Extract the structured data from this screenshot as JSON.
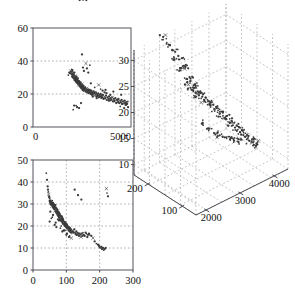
{
  "figure": {
    "background_color": "#ffffff",
    "point_color": "#3a3a3a",
    "axis_color": "#4a4a52",
    "grid_color": "#9a9a9a"
  },
  "chart_data": [
    {
      "id": "panel-top-left",
      "type": "scatter",
      "title": "",
      "xlabel": "",
      "ylabel": "",
      "xlim": [
        0,
        5000
      ],
      "ylim": [
        0,
        60
      ],
      "xticks": [
        0,
        5000
      ],
      "xticklabels": [
        "0",
        "5000"
      ],
      "yticks": [
        0,
        20,
        40,
        60
      ],
      "yticklabels": [
        "0",
        "20",
        "40",
        "60"
      ],
      "grid": true,
      "grid_axis": "y",
      "grid_values": [
        20,
        40
      ],
      "legend": null,
      "x": [
        1800,
        1850,
        1900,
        1920,
        1950,
        1970,
        1990,
        2000,
        2010,
        2020,
        2030,
        2050,
        2060,
        2080,
        2090,
        2100,
        2110,
        2120,
        2130,
        2150,
        2160,
        2170,
        2180,
        2190,
        2200,
        2210,
        2220,
        2230,
        2240,
        2250,
        2260,
        2270,
        2280,
        2290,
        2300,
        2310,
        2320,
        2330,
        2340,
        2350,
        2360,
        2370,
        2380,
        2390,
        2400,
        2410,
        2420,
        2430,
        2440,
        2450,
        2460,
        2470,
        2480,
        2490,
        2500,
        2510,
        2520,
        2530,
        2540,
        2550,
        2560,
        2570,
        2580,
        2590,
        2600,
        2620,
        2640,
        2660,
        2680,
        2700,
        2720,
        2740,
        2760,
        2780,
        2800,
        2820,
        2840,
        2860,
        2880,
        2900,
        2920,
        2940,
        2960,
        2980,
        3000,
        3030,
        3060,
        3090,
        3120,
        3150,
        3180,
        3210,
        3240,
        3270,
        3300,
        3330,
        3360,
        3390,
        3420,
        3450,
        3480,
        3510,
        3540,
        3570,
        3600,
        3640,
        3680,
        3720,
        3760,
        3800,
        3840,
        3880,
        3920,
        3960,
        4000,
        4040,
        4080,
        4120,
        4160,
        4200,
        4240,
        4280,
        4320,
        4360,
        4400,
        4440,
        4480,
        4520,
        4560,
        4600,
        4640,
        4680,
        4720,
        4760,
        4800,
        4840,
        2100,
        2450,
        2500,
        2700,
        2900,
        3100,
        3300,
        3500,
        3700,
        3900,
        4100,
        4300,
        4500,
        4700,
        2200,
        2350,
        2550,
        2750,
        2950,
        3150,
        3350,
        3550,
        3750,
        3950,
        4150,
        4350,
        4550,
        4750,
        2250,
        2050,
        2600,
        2820,
        3050,
        3250,
        3450,
        3650,
        3850,
        4050,
        4250,
        4450,
        4650,
        4850
      ],
      "y": [
        31.5,
        33.0,
        32.5,
        34.0,
        33.5,
        35.0,
        32.0,
        30.5,
        34.5,
        31.0,
        33.5,
        30.0,
        32.5,
        29.5,
        31.5,
        30.0,
        33.0,
        28.5,
        30.5,
        29.0,
        31.0,
        28.0,
        30.0,
        27.5,
        29.5,
        28.5,
        30.5,
        27.0,
        29.0,
        28.0,
        26.5,
        28.5,
        27.5,
        29.5,
        26.0,
        28.0,
        27.0,
        25.5,
        27.5,
        26.5,
        28.0,
        25.0,
        27.0,
        26.0,
        24.5,
        26.5,
        25.5,
        27.0,
        24.0,
        26.0,
        25.0,
        23.5,
        25.5,
        24.5,
        26.0,
        23.0,
        25.0,
        24.0,
        22.5,
        24.5,
        23.5,
        25.0,
        22.0,
        24.0,
        23.0,
        23.5,
        22.5,
        24.0,
        21.5,
        23.0,
        22.0,
        23.5,
        21.0,
        22.5,
        21.5,
        23.0,
        20.5,
        22.0,
        21.0,
        22.5,
        20.0,
        21.5,
        20.5,
        22.0,
        19.5,
        21.0,
        20.0,
        21.5,
        19.0,
        20.5,
        19.5,
        21.0,
        18.5,
        20.0,
        19.0,
        20.5,
        18.0,
        19.5,
        18.5,
        20.0,
        17.5,
        19.0,
        18.0,
        19.5,
        17.0,
        18.5,
        17.5,
        19.0,
        16.5,
        18.0,
        17.0,
        18.5,
        16.0,
        17.5,
        16.5,
        18.0,
        15.5,
        17.0,
        16.0,
        17.5,
        15.0,
        16.5,
        15.5,
        17.0,
        14.5,
        16.0,
        15.0,
        16.5,
        14.0,
        15.5,
        14.5,
        16.0,
        13.5,
        15.0,
        14.0,
        15.5,
        13.0,
        14.5,
        44.0,
        38.5,
        37.5,
        21.5,
        19.0,
        18.0,
        22.5,
        17.0,
        21.5,
        16.5,
        19.5,
        14.5,
        13.0,
        11.5,
        36.0,
        35.5,
        26.5,
        24.0,
        25.5,
        22.0,
        20.5,
        19.5,
        15.5,
        15.0,
        14.0,
        13.5,
        12.0,
        10.5,
        34.0,
        33.0,
        18.5,
        17.5,
        23.0,
        21.0,
        16.0,
        18.0,
        14.5,
        12.5,
        11.5,
        12.0,
        10.0,
        9.5
      ]
    },
    {
      "id": "panel-bottom-left",
      "type": "scatter",
      "title": "",
      "xlabel": "",
      "ylabel": "",
      "xlim": [
        0,
        300
      ],
      "ylim": [
        0,
        50
      ],
      "xticks": [
        0,
        100,
        200,
        300
      ],
      "xticklabels": [
        "0",
        "100",
        "200",
        "300"
      ],
      "yticks": [
        0,
        10,
        20,
        30,
        40,
        50
      ],
      "yticklabels": [
        "0",
        "10",
        "20",
        "30",
        "40",
        "50"
      ],
      "grid": true,
      "grid_axis": "both",
      "grid_values_x": [
        100,
        200
      ],
      "grid_values_y": [
        10,
        20,
        30,
        40
      ],
      "legend": null,
      "x": [
        40,
        42,
        44,
        45,
        46,
        47,
        48,
        49,
        50,
        50,
        51,
        52,
        52,
        53,
        54,
        55,
        55,
        56,
        57,
        58,
        58,
        59,
        60,
        60,
        61,
        62,
        62,
        63,
        64,
        64,
        65,
        66,
        66,
        67,
        68,
        68,
        69,
        70,
        70,
        71,
        72,
        72,
        73,
        74,
        74,
        75,
        76,
        76,
        77,
        78,
        78,
        79,
        80,
        80,
        81,
        82,
        82,
        83,
        84,
        85,
        85,
        86,
        87,
        88,
        88,
        89,
        90,
        90,
        91,
        92,
        93,
        94,
        95,
        95,
        96,
        97,
        98,
        99,
        100,
        100,
        101,
        102,
        103,
        104,
        105,
        106,
        107,
        108,
        109,
        110,
        111,
        112,
        113,
        114,
        115,
        116,
        118,
        120,
        122,
        124,
        126,
        128,
        130,
        132,
        134,
        136,
        138,
        140,
        142,
        144,
        146,
        148,
        150,
        152,
        155,
        158,
        160,
        163,
        165,
        168,
        170,
        175,
        180,
        185,
        190,
        195,
        198,
        200,
        202,
        205,
        207,
        210,
        212,
        215,
        218,
        220,
        222,
        225,
        50,
        52,
        58,
        65,
        70,
        78,
        85,
        92,
        100,
        108,
        115,
        125,
        135,
        145,
        55,
        60,
        68,
        75,
        82,
        88,
        95,
        102,
        110,
        120,
        130,
        140,
        150,
        160
      ],
      "y": [
        44.0,
        41.0,
        38.0,
        36.5,
        35.5,
        34.5,
        33.5,
        33.0,
        32.5,
        31.5,
        31.0,
        30.5,
        30.0,
        31.5,
        30.0,
        29.5,
        31.0,
        30.5,
        29.0,
        30.0,
        31.5,
        29.5,
        28.5,
        30.5,
        29.0,
        28.0,
        30.0,
        29.5,
        27.5,
        29.0,
        28.5,
        27.0,
        28.0,
        29.5,
        26.5,
        28.5,
        27.5,
        26.0,
        28.0,
        27.0,
        25.5,
        27.5,
        26.5,
        25.0,
        27.0,
        26.0,
        24.5,
        26.5,
        25.5,
        24.0,
        26.0,
        25.0,
        23.5,
        25.5,
        24.5,
        23.0,
        25.0,
        24.0,
        22.5,
        24.5,
        23.5,
        22.0,
        24.0,
        23.0,
        21.5,
        23.5,
        22.5,
        21.0,
        23.0,
        22.0,
        21.5,
        20.5,
        22.0,
        21.0,
        20.0,
        21.5,
        20.5,
        19.5,
        21.0,
        20.0,
        19.0,
        20.5,
        19.5,
        18.5,
        20.0,
        19.0,
        18.0,
        19.5,
        18.5,
        17.5,
        19.0,
        18.0,
        17.0,
        18.5,
        17.5,
        17.0,
        18.0,
        17.5,
        17.0,
        18.5,
        17.0,
        16.5,
        17.5,
        16.0,
        17.0,
        16.5,
        15.5,
        16.5,
        16.0,
        15.0,
        16.5,
        15.5,
        17.0,
        16.0,
        15.5,
        17.0,
        16.5,
        15.0,
        16.0,
        16.5,
        16.0,
        15.5,
        14.5,
        13.0,
        12.0,
        11.5,
        11.0,
        10.5,
        10.0,
        10.5,
        9.5,
        10.0,
        9.0,
        9.5,
        10.0,
        37.0,
        35.0,
        33.5,
        22.0,
        26.5,
        24.0,
        20.5,
        19.5,
        22.5,
        20.0,
        18.0,
        16.0,
        15.0,
        14.5,
        36.5,
        34.0,
        32.0,
        23.5,
        25.0,
        21.5,
        23.0,
        19.0,
        17.5,
        18.0,
        16.5,
        15.5,
        17.0,
        16.0
      ]
    },
    {
      "id": "panel-right-3d",
      "type": "scatter3d",
      "title": "",
      "xlabel": "",
      "ylabel": "",
      "zlabel": "",
      "xticks": [
        2000,
        3000,
        4000
      ],
      "xticklabels": [
        "2000",
        "3000",
        "4000"
      ],
      "yticks": [
        100,
        200
      ],
      "yticklabels": [
        "100",
        "200"
      ],
      "zticks": [
        10,
        15,
        20,
        25,
        30
      ],
      "zticklabels": [
        "10",
        "15",
        "20",
        "25",
        "30"
      ],
      "grid": true,
      "legend": null,
      "projection": "isometric",
      "points": [
        [
          2250,
          150,
          31.0
        ],
        [
          2400,
          160,
          30.0
        ],
        [
          2300,
          145,
          28.5
        ],
        [
          2500,
          155,
          27.5
        ],
        [
          2450,
          140,
          26.5
        ],
        [
          2600,
          150,
          26.0
        ],
        [
          2550,
          135,
          25.5
        ],
        [
          2700,
          145,
          24.5
        ],
        [
          2650,
          130,
          24.0
        ],
        [
          2800,
          140,
          23.5
        ],
        [
          2750,
          125,
          23.0
        ],
        [
          2900,
          135,
          22.5
        ],
        [
          2850,
          120,
          22.0
        ],
        [
          3000,
          130,
          21.5
        ],
        [
          2950,
          115,
          21.0
        ],
        [
          3100,
          125,
          20.5
        ],
        [
          3050,
          110,
          20.0
        ],
        [
          3200,
          120,
          19.5
        ],
        [
          3150,
          105,
          19.0
        ],
        [
          3300,
          115,
          18.5
        ],
        [
          3250,
          100,
          18.0
        ],
        [
          3400,
          110,
          17.5
        ],
        [
          3350,
          95,
          17.0
        ],
        [
          3500,
          105,
          16.5
        ],
        [
          3450,
          90,
          16.0
        ],
        [
          3600,
          100,
          15.5
        ],
        [
          3550,
          88,
          15.0
        ],
        [
          3700,
          95,
          14.5
        ],
        [
          3650,
          85,
          14.0
        ],
        [
          3800,
          92,
          13.5
        ],
        [
          2200,
          170,
          33.0
        ],
        [
          2350,
          165,
          31.5
        ],
        [
          2150,
          180,
          34.0
        ],
        [
          2050,
          190,
          35.5
        ],
        [
          2500,
          120,
          20.5
        ],
        [
          2600,
          110,
          19.5
        ],
        [
          2700,
          105,
          18.5
        ],
        [
          2800,
          100,
          18.0
        ],
        [
          2900,
          95,
          17.5
        ],
        [
          3000,
          90,
          17.0
        ],
        [
          3100,
          88,
          16.5
        ],
        [
          3200,
          85,
          16.0
        ],
        [
          2400,
          175,
          29.0
        ],
        [
          2300,
          185,
          30.5
        ],
        [
          2600,
          165,
          25.0
        ],
        [
          2550,
          170,
          26.0
        ],
        [
          2700,
          160,
          24.0
        ],
        [
          2650,
          155,
          23.5
        ]
      ]
    }
  ]
}
